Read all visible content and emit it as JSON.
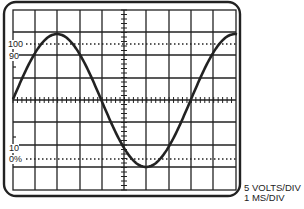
{
  "figure": {
    "scale_labels": {
      "top": "100",
      "upper": "90",
      "lower": "10",
      "bottom": "0%"
    },
    "caption": {
      "volts": "5 VOLTS/DIV",
      "time": "1 MS/DIV"
    },
    "colors": {
      "line": "#222222",
      "background": "#ffffff"
    }
  },
  "chart_data": {
    "type": "line",
    "xlabel": "1 MS/DIV",
    "ylabel": "5 VOLTS/DIV",
    "grid": true,
    "divisions": {
      "x": 10,
      "y": 8
    },
    "reference_levels": [
      {
        "label": "100",
        "style": "dotted"
      },
      {
        "label": "90",
        "style": "tick"
      },
      {
        "label": "10",
        "style": "tick"
      },
      {
        "label": "0%",
        "style": "dotted"
      }
    ],
    "series": [
      {
        "name": "sine wave",
        "shape": "sine",
        "period_divisions": 8,
        "amplitude_divisions": 3.5
      }
    ]
  }
}
